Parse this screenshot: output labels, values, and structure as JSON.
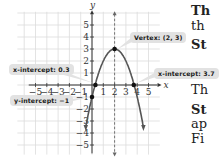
{
  "chart_data": {
    "type": "line",
    "title": "",
    "function": "parabola opening downward",
    "xlabel": "x",
    "ylabel": "y",
    "xlim": [
      -5.5,
      5.8
    ],
    "ylim": [
      -5.7,
      5.9
    ],
    "grid": true,
    "x_ticks": [
      -5,
      -4,
      -3,
      -2,
      -1,
      1,
      2,
      3,
      4,
      5
    ],
    "y_ticks": [
      -5,
      -4,
      -3,
      -2,
      -1,
      1,
      2,
      3,
      4,
      5
    ],
    "x_tick_labels": [
      "−5",
      "−4",
      "−3",
      "−2",
      "−1",
      "1",
      "2",
      "3",
      "4",
      "5"
    ],
    "y_tick_labels": [
      "−5",
      "−4",
      "−3",
      "−2",
      "−1",
      "1",
      "2",
      "3",
      "4",
      "5"
    ],
    "axis_of_symmetry": 2,
    "points": [
      {
        "name": "vertex",
        "x": 2,
        "y": 3
      },
      {
        "name": "x-intercept-left",
        "x": 0.3,
        "y": 0
      },
      {
        "name": "x-intercept-right",
        "x": 3.7,
        "y": 0
      },
      {
        "name": "y-intercept",
        "x": 0,
        "y": -1
      }
    ],
    "annotations": [
      {
        "label": "Vertex: (2, 3)",
        "target": "vertex"
      },
      {
        "label": "x-intercept: 0.3",
        "target": "x-intercept-left"
      },
      {
        "label": "x-intercept: 3.7",
        "target": "x-intercept-right"
      },
      {
        "label": "y-intercept: −1",
        "target": "y-intercept"
      }
    ]
  },
  "callouts": {
    "vertex": "Vertex: (2, 3)",
    "x_int_left": "x-intercept: 0.3",
    "x_int_right": "x-intercept: 3.7",
    "y_int": "y-intercept: −1"
  },
  "axis_labels": {
    "x": "x",
    "y": "y"
  },
  "side_text": {
    "line1": "Th",
    "line2": "th",
    "line3": "St",
    "line4": "Th",
    "line5": "St",
    "line6": "ap",
    "line7": "Fi"
  }
}
